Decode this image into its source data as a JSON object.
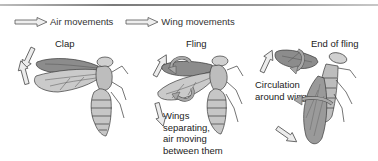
{
  "legend": {
    "items": [
      {
        "icon": "hollow-arrow-right-icon",
        "label": "Air movements"
      },
      {
        "icon": "hollow-arrow-right-icon",
        "label": "Wing movements"
      }
    ]
  },
  "stages": [
    {
      "title": "Clap"
    },
    {
      "title": "Fling",
      "annotation": [
        "Wings",
        "separating,",
        "air moving",
        "between them"
      ]
    },
    {
      "title": "End of fling",
      "annotation": [
        "Circulation",
        "around wings"
      ]
    }
  ],
  "colors": {
    "arrow_fill": "#e9e9e9",
    "arrow_stroke": "#555555",
    "wing_dark": "#8c8c8c",
    "wing_light": "#c9c9c9",
    "body_fill": "#c4c4c4",
    "outline": "#3a3a3a",
    "rule": "#8a8a8a"
  }
}
